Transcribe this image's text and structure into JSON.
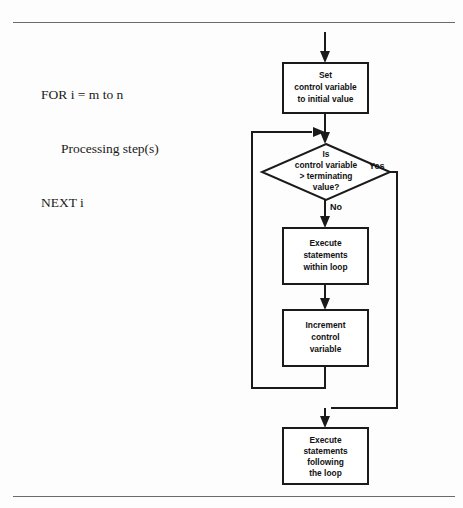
{
  "page": {
    "background_color": "#fdfdfd",
    "ink_color": "#1a1a1a",
    "rule_color": "#6b6b6b"
  },
  "pseudocode": {
    "line1": "FOR i = m to n",
    "line2": "Processing step(s)",
    "line3": "NEXT i"
  },
  "flowchart": {
    "title": "FOR loop control flow",
    "start_connector": "entry-arrow",
    "nodes": {
      "init": {
        "shape": "process",
        "line1": "Set",
        "line2": "control variable",
        "line3": "to initial value"
      },
      "decision": {
        "shape": "decision",
        "line1": "Is",
        "line2": "control variable",
        "line3": "> terminating",
        "line4": "value?"
      },
      "body": {
        "shape": "process",
        "line1": "Execute",
        "line2": "statements",
        "line3": "within loop"
      },
      "increment": {
        "shape": "process",
        "line1": "Increment",
        "line2": "control",
        "line3": "variable"
      },
      "exit": {
        "shape": "process",
        "line1": "Execute",
        "line2": "statements",
        "line3": "following",
        "line4": "the loop"
      }
    },
    "branch_labels": {
      "yes": "Yes",
      "no": "No"
    }
  }
}
